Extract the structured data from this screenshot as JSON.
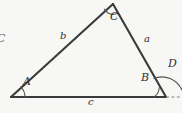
{
  "figure": {
    "kind": "geometry-diagram",
    "background_color": "#f7f7f5",
    "stroke_color": "#3a3a3a",
    "arc_color": "#555555",
    "dash_color": "#777777",
    "width": 182,
    "height": 113
  },
  "vertices": [
    {
      "id": "A",
      "label": "A",
      "x": 11,
      "y": 97,
      "label_x": 23,
      "label_y": 82
    },
    {
      "id": "B",
      "label": "B",
      "x": 166,
      "y": 97,
      "label_x": 141,
      "label_y": 78
    },
    {
      "id": "C",
      "label": "C",
      "x": 113,
      "y": 4,
      "label_x": 110,
      "label_y": 14
    }
  ],
  "sides": [
    {
      "id": "a",
      "label": "a",
      "from": "C",
      "to": "B",
      "label_x": 144,
      "label_y": 39
    },
    {
      "id": "b",
      "label": "b",
      "from": "A",
      "to": "C",
      "label_x": 60,
      "label_y": 36
    },
    {
      "id": "c",
      "label": "c",
      "from": "A",
      "to": "B",
      "label_x": 88,
      "label_y": 98
    }
  ],
  "exterior_angle": {
    "id": "D",
    "label": "D",
    "at_vertex": "B",
    "label_x": 168,
    "label_y": 63
  },
  "margin_label": {
    "text": "C",
    "x": -2,
    "y": 33,
    "note": "partially cropped character at left edge"
  },
  "extension_line": {
    "style": "dashed",
    "from_x": 166,
    "from_y": 97,
    "to_x": 182,
    "to_y": 97
  },
  "arcs": [
    {
      "at": "A",
      "radius": 14,
      "kind": "angle-arc"
    },
    {
      "at": "C",
      "radius": 10,
      "kind": "angle-arc"
    },
    {
      "at": "B",
      "radius": 12,
      "kind": "angle-arc"
    },
    {
      "at": "B",
      "radius": 22,
      "kind": "exterior-angle-arc"
    }
  ]
}
